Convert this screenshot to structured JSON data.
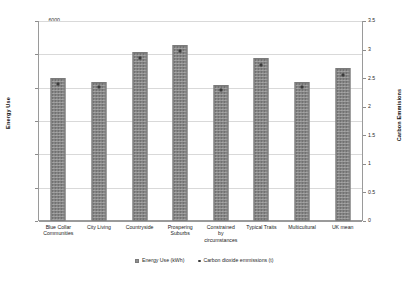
{
  "chart_data": {
    "type": "bar",
    "title": "",
    "xlabel": "",
    "ylabel": "Energy Use",
    "y2label": "Carbon Emmisions",
    "ylim": [
      0,
      6000
    ],
    "y2lim": [
      0,
      3.5
    ],
    "yticks": [
      "0",
      "1000",
      "2000",
      "3000",
      "4000",
      "5000",
      "6000"
    ],
    "ytick_values": [
      0,
      1000,
      2000,
      3000,
      4000,
      5000,
      6000
    ],
    "y2ticks": [
      "0",
      "0.5",
      "1",
      "1.5",
      "2",
      "2.5",
      "3",
      "3.5"
    ],
    "y2tick_values": [
      0,
      0.5,
      1,
      1.5,
      2,
      2.5,
      3,
      3.5
    ],
    "grid": true,
    "legend_position": "bottom",
    "categories": [
      "Blue Collar\nCommunities",
      "City Living",
      "Countryside",
      "Prospering\nSuburbs",
      "Constrained\nby\ncircumstances",
      "Typical Traits",
      "Multicultural",
      "UK mean"
    ],
    "series": [
      {
        "name": "Energy Use (kWh)",
        "kind": "bar",
        "axis": "left",
        "values": [
          4280,
          4180,
          5080,
          5280,
          4080,
          4880,
          4180,
          4580
        ]
      },
      {
        "name": "Carbon dioxide emmissions (t)",
        "kind": "marker",
        "axis": "right",
        "values": [
          2.4,
          2.35,
          2.85,
          2.97,
          2.3,
          2.73,
          2.35,
          2.55
        ]
      }
    ]
  },
  "legend": {
    "items": [
      {
        "label": "Energy Use (kWh)",
        "swatch": "bar-swatch"
      },
      {
        "label": "Carbon dioxide emmissions (t)",
        "swatch": "dot-swatch"
      }
    ]
  },
  "caption": {
    "text": ""
  },
  "colors": {
    "bar_fill": "#8f8f8f",
    "bar_edge": "#7b7b7b",
    "marker": "#3b3b3b",
    "gridline": "#d9d9d9",
    "axis": "#9a9a9a",
    "text": "#1a1a1a",
    "background": "#ffffff"
  }
}
